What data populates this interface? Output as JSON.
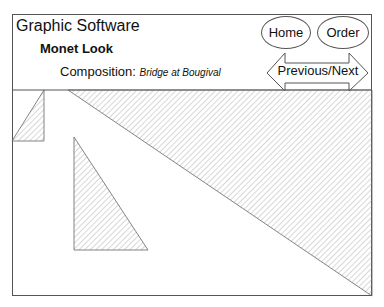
{
  "header": {
    "app_title": "Graphic Software",
    "style_title": "Monet Look",
    "composition_label": "Composition:",
    "composition_value": "Bridge at Bougival"
  },
  "nav": {
    "home_label": "Home",
    "order_label": "Order",
    "prevnext_label": "Previous/Next"
  },
  "canvas": {
    "hatch_color": "#9a9a9a",
    "line_color": "#555555",
    "shapes": [
      {
        "name": "small-left-triangle",
        "points": "12,141 44,90 44,141"
      },
      {
        "name": "large-right-triangle",
        "points": "68,90 372,90 372,296"
      },
      {
        "name": "middle-triangle",
        "points": "74,137 74,250 148,250"
      }
    ]
  }
}
